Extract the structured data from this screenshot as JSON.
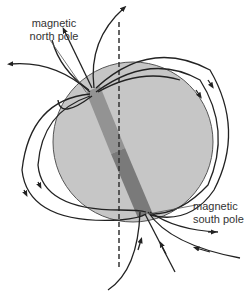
{
  "diagram": {
    "labels": {
      "north_pole_line1": "magnetic",
      "north_pole_line2": "north pole",
      "south_pole_line1": "magnetic",
      "south_pole_line2": "south pole"
    },
    "colors": {
      "sphere_fill": "#c4c4c4",
      "sphere_stroke": "#555555",
      "bar_north": "#8f8f8f",
      "bar_south": "#767676",
      "field_line": "#222222",
      "axis_dash": "#333333",
      "label_text": "#333333"
    },
    "elements": {
      "sphere": "planet-sphere",
      "bar": "magnetic-bar",
      "axis": "rotation-axis-dashed",
      "field_lines": "magnetic-field-lines"
    }
  }
}
